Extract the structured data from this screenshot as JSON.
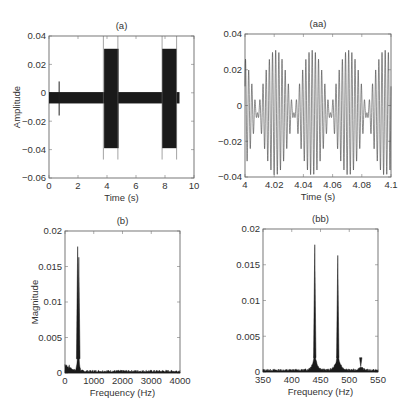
{
  "chart_data": [
    {
      "id": "a",
      "type": "line",
      "title": "(a)",
      "xlabel": "Time (s)",
      "ylabel": "Amplitude",
      "xlim": [
        0,
        10
      ],
      "ylim": [
        -0.06,
        0.04
      ],
      "xticks": [
        0,
        2,
        4,
        6,
        8,
        10
      ],
      "yticks": [
        -0.06,
        -0.04,
        -0.02,
        0,
        0.02,
        0.04
      ],
      "xtick_labels": [
        "0",
        "2",
        "4",
        "6",
        "8",
        "10"
      ],
      "ytick_labels": [
        "-0.06",
        "-0.04",
        "-0.02",
        "0",
        "0.02",
        "0.04"
      ],
      "grid": false,
      "description": "Dense oscillating time signal: low-level band (~-0.007 to 0) from 0 to 9 s, a spike at ~0.7 s (+0.008/-0.016), and two high-amplitude bursts (~+0.031 to -0.039) at 3.8-4.8 s and 7.8-8.8 s, each bracketed by thin vertical marker lines from 0.04 to -0.047.",
      "segments": [
        {
          "t_start": 0.0,
          "t_end": 9.0,
          "ymin": -0.0075,
          "ymax": 0.0005,
          "label": "background"
        },
        {
          "t_start": 3.8,
          "t_end": 4.8,
          "ymin": -0.039,
          "ymax": 0.031,
          "label": "burst 1"
        },
        {
          "t_start": 7.8,
          "t_end": 8.8,
          "ymin": -0.039,
          "ymax": 0.031,
          "label": "burst 2"
        }
      ],
      "spike": {
        "t": 0.7,
        "ymin": -0.016,
        "ymax": 0.008
      },
      "marker_lines": [
        3.75,
        4.75,
        7.8,
        8.8
      ],
      "marker_line_range": [
        -0.047,
        0.04
      ]
    },
    {
      "id": "aa",
      "type": "line",
      "title": "(aa)",
      "xlabel": "Time (s)",
      "ylabel": "",
      "xlim": [
        4,
        4.1
      ],
      "ylim": [
        -0.04,
        0.04
      ],
      "xticks": [
        4,
        4.02,
        4.04,
        4.06,
        4.08,
        4.1
      ],
      "yticks": [
        -0.04,
        -0.02,
        0,
        0.02,
        0.04
      ],
      "xtick_labels": [
        "4",
        "4.02",
        "4.04",
        "4.06",
        "4.08",
        "4.1"
      ],
      "ytick_labels": [
        "-0.04",
        "-0.02",
        "0",
        "0.02",
        "0.04"
      ],
      "grid": false,
      "description": "Zoom of burst showing beat pattern from two tones (~440 Hz and ~480 Hz), beat period ~0.025 s, envelope max ~0.031 / min ~-0.039, small DC offset ~-0.004.",
      "signal": {
        "f1_hz": 440,
        "f2_hz": 480,
        "amp_each": 0.0175,
        "offset": -0.004,
        "beat_period_s": 0.025
      }
    },
    {
      "id": "b",
      "type": "line",
      "title": "(b)",
      "xlabel": "Frequency (Hz)",
      "ylabel": "Magnitude",
      "xlim": [
        0,
        4000
      ],
      "ylim": [
        0,
        0.02
      ],
      "xticks": [
        0,
        1000,
        2000,
        3000,
        4000
      ],
      "yticks": [
        0,
        0.005,
        0.01,
        0.015,
        0.02
      ],
      "xtick_labels": [
        "0",
        "1000",
        "2000",
        "3000",
        "4000"
      ],
      "ytick_labels": [
        "0",
        "0.005",
        "0.01",
        "0.015",
        "0.02"
      ],
      "grid": false,
      "peaks": [
        {
          "x": 440,
          "y": 0.0178
        },
        {
          "x": 480,
          "y": 0.0163
        }
      ],
      "noise_floor": 0.0003,
      "low_freq_hump": {
        "x_range": [
          0,
          400
        ],
        "y_max": 0.0012
      }
    },
    {
      "id": "bb",
      "type": "line",
      "title": "(bb)",
      "xlabel": "Frequency (Hz)",
      "ylabel": "",
      "xlim": [
        350,
        550
      ],
      "ylim": [
        0,
        0.02
      ],
      "xticks": [
        350,
        400,
        450,
        500,
        550
      ],
      "yticks": [
        0,
        0.005,
        0.01,
        0.015,
        0.02
      ],
      "xtick_labels": [
        "350",
        "400",
        "450",
        "500",
        "550"
      ],
      "ytick_labels": [
        "0",
        "0.005",
        "0.01",
        "0.015",
        "0.02"
      ],
      "grid": false,
      "peaks": [
        {
          "x": 440,
          "y": 0.0178
        },
        {
          "x": 480,
          "y": 0.0163
        },
        {
          "x": 520,
          "y": 0.0008
        }
      ],
      "noise_floor": 0.0003
    }
  ]
}
